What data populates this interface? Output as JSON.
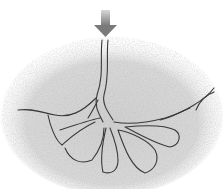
{
  "illustration": {
    "subject": "pencil sketch of a channel branching into cavities in soil",
    "colors": {
      "background": "#ffffff",
      "soil": "#c8c8c8",
      "soil_dark": "#a8a8a8",
      "outline": "#3a3a3a",
      "arrow": "#8a8a8a"
    }
  }
}
